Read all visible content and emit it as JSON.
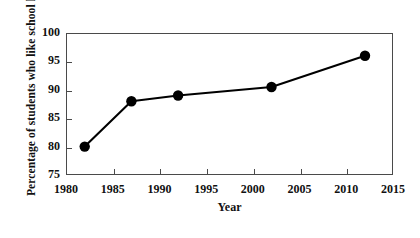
{
  "chart_data": {
    "type": "line",
    "title": "",
    "xlabel": "Year",
    "ylabel": "Percentage of students who like school life",
    "xlim": [
      1980,
      2015
    ],
    "ylim": [
      75,
      100
    ],
    "xticks": [
      1980,
      1985,
      1990,
      1995,
      2000,
      2005,
      2010,
      2015
    ],
    "yticks": [
      75,
      80,
      85,
      90,
      95,
      100
    ],
    "grid": false,
    "legend": "none",
    "marker": "filled-circle",
    "series": [
      {
        "name": "Percentage of students who like school life",
        "color": "#000000",
        "x": [
          1982,
          1987,
          1992,
          2002,
          2012
        ],
        "values": [
          80,
          88,
          89,
          90.5,
          96
        ]
      }
    ]
  },
  "axes": {
    "x_title": "Year",
    "y_title": "Percentage of students who like school life",
    "x_tick_labels": [
      "1980",
      "1985",
      "1990",
      "1995",
      "2000",
      "2005",
      "2010",
      "2015"
    ],
    "y_tick_labels": [
      "75",
      "80",
      "85",
      "90",
      "95",
      "100"
    ]
  },
  "colors": {
    "line": "#000000",
    "marker": "#000000",
    "frame": "#4a4a4a",
    "background": "#ffffff",
    "text": "#111111"
  }
}
